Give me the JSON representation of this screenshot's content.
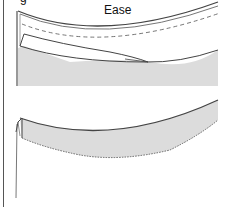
{
  "figure": {
    "top_partial_glyph": "g",
    "ease_label": "Ease",
    "colors": {
      "fabric_fill": "#dcdcdc",
      "outline": "#444444",
      "dash": "#666666",
      "background": "#ffffff"
    },
    "panels": [
      {
        "name": "top-panel",
        "description": "Curved hem with folded edge, dashed ease line and tapered fold"
      },
      {
        "name": "bottom-panel",
        "description": "Curved hem band with pinked/raw lower edge and thread"
      }
    ]
  }
}
